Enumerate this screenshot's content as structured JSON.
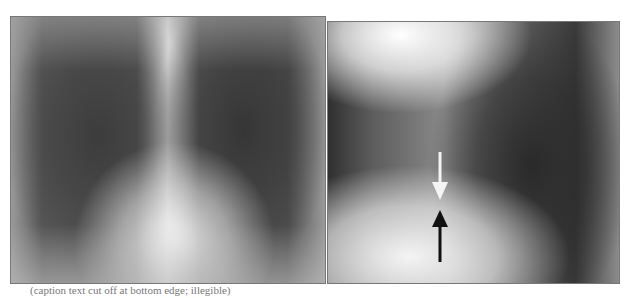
{
  "figure": {
    "panels": [
      {
        "id": "left",
        "description": "Frontal (PA) chest radiograph"
      },
      {
        "id": "right",
        "description": "Lateral chest radiograph with annotation arrows"
      }
    ],
    "annotations": {
      "white_arrow": "pointing down",
      "black_arrow": "pointing up"
    },
    "caption": "(caption text cut off at bottom edge; illegible)"
  }
}
